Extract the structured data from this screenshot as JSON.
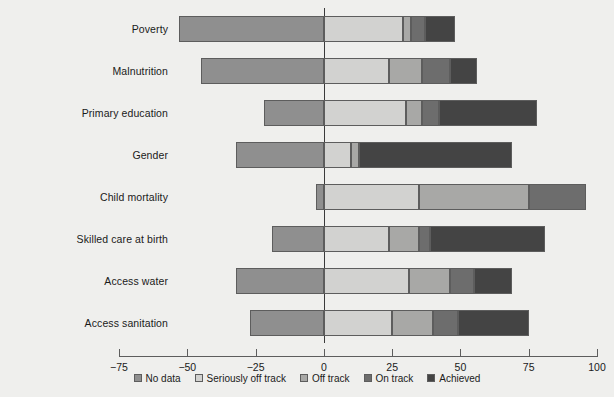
{
  "chart_data": {
    "type": "bar",
    "orientation": "horizontal",
    "stacked": true,
    "title": "",
    "xlabel": "",
    "ylabel": "",
    "xlim": [
      -75,
      100
    ],
    "xticks": [
      -75,
      -50,
      -25,
      0,
      25,
      50,
      75,
      100
    ],
    "xtick_labels": [
      "−75",
      "−50",
      "−25",
      "0",
      "25",
      "50",
      "75",
      "100"
    ],
    "grid": false,
    "legend_position": "bottom-center",
    "categories": [
      "Poverty",
      "Malnutrition",
      "Primary education",
      "Gender",
      "Child mortality",
      "Skilled care at birth",
      "Access water",
      "Access sanitation"
    ],
    "series": [
      {
        "name": "No data",
        "color": "#8f8f8f",
        "values": [
          53,
          45,
          22,
          32,
          3,
          19,
          32,
          27
        ],
        "note": "plotted as negative extent to the left of zero"
      },
      {
        "name": "Seriously off track",
        "color": "#d2d2d0",
        "values": [
          29,
          24,
          30,
          10,
          35,
          24,
          31,
          25
        ]
      },
      {
        "name": "Off track",
        "color": "#a8a8a6",
        "values": [
          3,
          12,
          6,
          3,
          40,
          11,
          15,
          15
        ]
      },
      {
        "name": "On track",
        "color": "#6d6d6d",
        "values": [
          5,
          10,
          6,
          0,
          21,
          4,
          9,
          9
        ]
      },
      {
        "name": "Achieved",
        "color": "#444444",
        "values": [
          11,
          10,
          36,
          56,
          0,
          42,
          14,
          26
        ]
      }
    ],
    "bar_totals_left": [
      53,
      45,
      22,
      32,
      3,
      19,
      32,
      27
    ],
    "bar_totals_right": [
      48,
      56,
      78,
      69,
      96,
      81,
      69,
      75
    ],
    "legend_entries": [
      "No data",
      "Seriously off track",
      "Off track",
      "On track",
      "Achieved"
    ]
  },
  "colors": {
    "background": "#efefed",
    "axis": "#5d5d5d",
    "zero_line": "#3a3a3a",
    "text": "#1a1a1a",
    "no_data": "#8f8f8f",
    "seriously_off_track": "#d2d2d0",
    "off_track": "#a8a8a6",
    "on_track": "#6d6d6d",
    "achieved": "#444444"
  },
  "footnote": ""
}
